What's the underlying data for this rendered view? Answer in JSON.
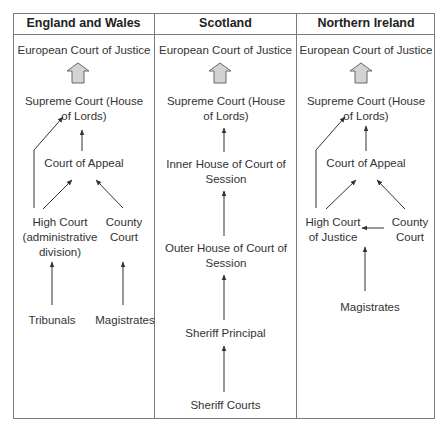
{
  "columns": [
    {
      "header": "England and Wales",
      "nodes": {
        "ecj": "European Court of Justice",
        "supreme": "Supreme Court (House of Lords)",
        "appeal": "Court of Appeal",
        "high": "High Court (administrative division)",
        "county": "County Court",
        "tribunals": "Tribunals",
        "magistrates": "Magistrates"
      }
    },
    {
      "header": "Scotland",
      "nodes": {
        "ecj": "European Court of Justice",
        "supreme": "Supreme Court (House of Lords)",
        "inner": "Inner House of Court of Session",
        "outer": "Outer House of Court of Session",
        "principal": "Sheriff Principal",
        "sheriff": "Sheriff Courts"
      }
    },
    {
      "header": "Northern Ireland",
      "nodes": {
        "ecj": "European Court of Justice",
        "supreme": "Supreme Court (House of Lords)",
        "appeal": "Court of Appeal",
        "high": "High Court of Justice",
        "county": "County Court",
        "magistrates": "Magistrates"
      }
    }
  ],
  "colors": {
    "border": "#7a7a7a",
    "arrow": "#333333",
    "block_arrow_fill": "#d0d0d0",
    "block_arrow_stroke": "#666666"
  }
}
